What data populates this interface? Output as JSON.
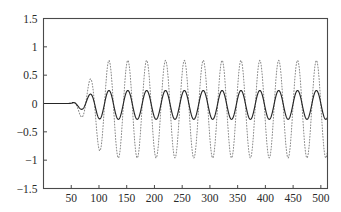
{
  "chart_data": {
    "type": "line",
    "title": "",
    "subtitle": "",
    "xlabel": "",
    "ylabel": "",
    "xlim": [
      0,
      512
    ],
    "ylim": [
      -1.5,
      1.5
    ],
    "grid": false,
    "legend": "none",
    "xticks": [
      50,
      100,
      150,
      200,
      250,
      300,
      350,
      400,
      450,
      500
    ],
    "xtick_labels": [
      "50",
      "100",
      "150",
      "200",
      "250",
      "300",
      "350",
      "400",
      "450",
      "500"
    ],
    "yticks": [
      -1.5,
      -1,
      -0.5,
      0,
      0.5,
      1,
      1.5
    ],
    "ytick_labels": [
      "-1.5",
      "-1",
      "-0.5",
      "0",
      "0.5",
      "1",
      "1.5"
    ],
    "series": [
      {
        "name": "large-amplitude-dotted",
        "style": "dotted",
        "color": "#8a8a8a",
        "onset_x": 56,
        "period": 34,
        "phase_x": 84,
        "peak_value": 0.76,
        "trough_value": -0.96,
        "offset": -0.1,
        "ramp_x": 118
      },
      {
        "name": "small-amplitude-solid",
        "style": "solid",
        "color": "#262626",
        "onset_x": 52,
        "period": 34,
        "phase_x": 84,
        "peak_value": 0.23,
        "trough_value": -0.28,
        "offset": -0.025,
        "ramp_x": 108
      }
    ]
  },
  "axes": {
    "box_color": "#4a4a4a",
    "background": "#ffffff"
  }
}
